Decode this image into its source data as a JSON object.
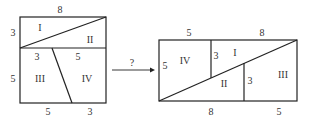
{
  "left_figure": {
    "description": "8x8 square dissected into pieces I, II, III, IV",
    "labels": {
      "top": "8",
      "left_top": "3",
      "left_bottom": "5",
      "mid_left": "3",
      "mid_right": "5",
      "bottom_left": "5",
      "bottom_right": "3"
    },
    "pieces": [
      "I",
      "II",
      "III",
      "IV"
    ]
  },
  "arrow": {
    "label": "?"
  },
  "right_figure": {
    "description": "5x13 rectangle rearranged from pieces",
    "labels": {
      "top_left": "5",
      "top_right": "8",
      "left": "5",
      "inner_left": "3",
      "inner_right": "3",
      "bottom_left": "8",
      "bottom_right": "5"
    },
    "pieces": [
      "IV",
      "I",
      "II",
      "III"
    ]
  },
  "colors": {
    "line": "#222222",
    "text": "#333333",
    "background": "#ffffff"
  }
}
